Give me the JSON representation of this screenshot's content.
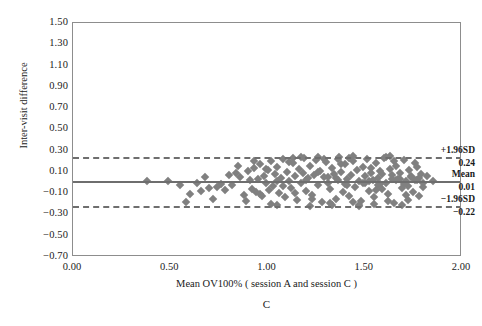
{
  "chart_data": {
    "type": "scatter",
    "title": "",
    "panel_letter": "C",
    "xlabel": "Mean OV100% ( session A and session C )",
    "ylabel": "Inter-visit difference",
    "xlim": [
      0.0,
      2.0
    ],
    "ylim": [
      -0.7,
      1.5
    ],
    "grid": false,
    "legend": "none",
    "xticks": [
      "0.00",
      "0.50",
      "1.00",
      "1.50",
      "2.00"
    ],
    "xtick_values": [
      0.0,
      0.5,
      1.0,
      1.5,
      2.0
    ],
    "yticks": [
      "1.50",
      "1.30",
      "1.10",
      "0.90",
      "0.70",
      "0.50",
      "0.30",
      "0.10",
      "-0.10",
      "-0.30",
      "-0.50",
      "-0.70"
    ],
    "ytick_values": [
      1.5,
      1.3,
      1.1,
      0.9,
      0.7,
      0.5,
      0.3,
      0.1,
      -0.1,
      -0.3,
      -0.5,
      -0.7
    ],
    "marker_color": "#808080",
    "line_color": "#6e6e6e",
    "reference_lines": [
      {
        "name": "upper-loa",
        "label": "+1.96SD",
        "value_label": "0.24",
        "value": 0.24,
        "style": "dashed"
      },
      {
        "name": "mean-bias",
        "label": "Mean",
        "value_label": "0.01",
        "value": 0.01,
        "style": "solid"
      },
      {
        "name": "lower-loa",
        "label": "-1.96SD",
        "value_label": "-0.22",
        "value": -0.22,
        "style": "dashed"
      }
    ],
    "x": [
      0.38,
      0.49,
      0.55,
      0.6,
      0.64,
      0.66,
      0.7,
      0.72,
      0.74,
      0.76,
      0.8,
      0.82,
      0.84,
      0.86,
      0.88,
      0.9,
      0.91,
      0.92,
      0.93,
      0.94,
      0.95,
      0.96,
      0.97,
      0.98,
      0.99,
      1.0,
      1.01,
      1.02,
      1.03,
      1.04,
      1.05,
      1.06,
      1.07,
      1.08,
      1.09,
      1.1,
      1.11,
      1.12,
      1.13,
      1.14,
      1.15,
      1.16,
      1.17,
      1.18,
      1.19,
      1.2,
      1.21,
      1.22,
      1.23,
      1.24,
      1.25,
      1.26,
      1.27,
      1.28,
      1.29,
      1.3,
      1.31,
      1.32,
      1.33,
      1.34,
      1.35,
      1.36,
      1.37,
      1.38,
      1.39,
      1.4,
      1.41,
      1.42,
      1.43,
      1.44,
      1.45,
      1.46,
      1.47,
      1.48,
      1.49,
      1.5,
      1.51,
      1.52,
      1.53,
      1.54,
      1.55,
      1.56,
      1.57,
      1.58,
      1.59,
      1.6,
      1.61,
      1.62,
      1.63,
      1.64,
      1.65,
      1.66,
      1.67,
      1.68,
      1.69,
      1.7,
      1.71,
      1.72,
      1.73,
      1.74,
      1.75,
      1.76,
      1.77,
      1.78,
      1.79,
      1.8,
      1.82,
      1.85,
      0.58,
      0.68,
      0.78,
      0.85,
      0.89,
      0.93,
      0.96,
      0.99,
      1.02,
      1.05,
      1.08,
      1.11,
      1.14,
      1.17,
      1.2,
      1.23,
      1.26,
      1.29,
      1.32,
      1.35,
      1.38,
      1.41,
      1.44,
      1.47,
      1.5,
      1.53,
      1.56,
      1.59,
      1.62,
      1.65,
      1.68,
      1.71,
      1.74,
      1.77,
      1.8,
      1.26,
      1.33,
      1.42,
      1.55,
      1.63,
      1.47,
      1.52,
      1.58,
      1.66,
      1.72,
      1.36,
      1.44,
      1.61,
      1.69,
      1.78,
      1.05,
      1.13,
      1.22,
      1.31,
      1.4,
      1.49,
      1.57,
      1.64,
      1.7,
      1.76
    ],
    "y": [
      0.01,
      0.01,
      -0.02,
      -0.11,
      0.0,
      -0.08,
      -0.05,
      -0.15,
      -0.04,
      -0.01,
      0.07,
      -0.02,
      0.09,
      0.05,
      -0.12,
      0.11,
      0.02,
      -0.06,
      0.14,
      -0.09,
      0.03,
      0.17,
      -0.13,
      0.06,
      0.0,
      0.12,
      -0.07,
      0.2,
      -0.03,
      0.08,
      0.15,
      -0.1,
      0.04,
      0.22,
      -0.14,
      0.1,
      0.01,
      -0.05,
      0.18,
      0.06,
      -0.16,
      0.13,
      0.0,
      0.09,
      0.23,
      -0.08,
      0.04,
      0.16,
      -0.12,
      0.07,
      0.21,
      -0.02,
      0.11,
      -0.18,
      0.05,
      0.19,
      0.0,
      -0.06,
      0.14,
      0.08,
      -0.15,
      0.02,
      0.24,
      0.1,
      -0.09,
      0.17,
      0.03,
      -0.13,
      0.07,
      0.2,
      -0.04,
      0.12,
      0.01,
      -0.17,
      0.15,
      0.06,
      0.22,
      -0.08,
      0.09,
      0.02,
      -0.14,
      0.18,
      0.04,
      0.11,
      -0.06,
      0.23,
      0.0,
      -0.11,
      0.13,
      0.07,
      -0.19,
      0.16,
      0.03,
      0.09,
      -0.05,
      0.21,
      0.01,
      -0.16,
      0.12,
      0.05,
      -0.09,
      0.18,
      0.02,
      -0.13,
      0.08,
      0.0,
      0.06,
      0.01,
      -0.18,
      0.05,
      -0.07,
      0.16,
      -0.17,
      0.2,
      -0.11,
      0.13,
      -0.2,
      0.01,
      -0.03,
      0.19,
      -0.1,
      0.24,
      0.02,
      -0.15,
      0.1,
      0.22,
      -0.19,
      0.04,
      0.17,
      -0.02,
      0.25,
      -0.21,
      0.0,
      0.14,
      -0.07,
      0.08,
      -0.17,
      0.2,
      0.03,
      -0.12,
      0.06,
      0.15,
      -0.04,
      0.24,
      -0.21,
      0.23,
      -0.2,
      0.25,
      -0.22,
      0.01,
      -0.01,
      0.02,
      -0.03,
      0.22,
      -0.18,
      0.24,
      -0.21,
      0.04,
      -0.21,
      0.23,
      -0.22,
      0.05,
      -0.01,
      0.0,
      -0.02,
      0.03,
      -0.01,
      0.02
    ]
  }
}
